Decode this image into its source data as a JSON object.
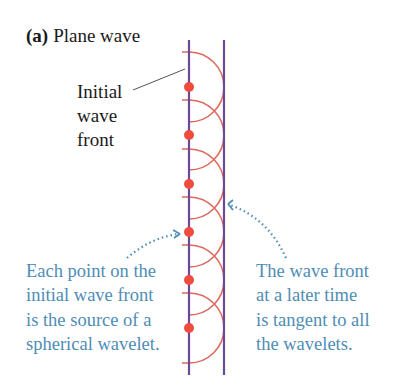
{
  "title": {
    "prefix": "(a)",
    "text": "Plane wave"
  },
  "initial_label": [
    "Initial",
    "wave",
    "front"
  ],
  "left_caption": [
    "Each point on the",
    "initial wave front",
    "is the source of a",
    "spherical wavelet."
  ],
  "right_caption": [
    "The wave front",
    "at a later time",
    "is tangent to all",
    "the wavelets."
  ],
  "colors": {
    "wavefront": "#6a4a95",
    "wavelet": "#e06a5e",
    "source_dot": "#ef4b3f",
    "caption": "#4e8db5",
    "text": "#1a1a1a"
  },
  "geometry": {
    "initial_front_x": 189,
    "later_front_x": 224,
    "front_top": 40,
    "front_bottom": 375,
    "wavelet_radius": 35,
    "source_y": [
      87,
      135,
      184,
      232,
      280,
      328
    ]
  }
}
